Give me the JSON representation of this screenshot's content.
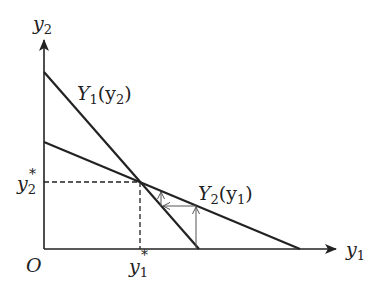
{
  "diagram": {
    "type": "reaction-function-diagram",
    "axes": {
      "x_label": "y",
      "x_label_sub": "1",
      "y_label": "y",
      "y_label_sub": "2",
      "origin_label": "O"
    },
    "curves": [
      {
        "name": "Y1(y2)",
        "label_main": "Y",
        "label_sub": "1",
        "label_arg": "(y",
        "label_arg_sub": "2",
        "label_close": ")"
      },
      {
        "name": "Y2(y1)",
        "label_main": "Y",
        "label_sub": "2",
        "label_arg": "(y",
        "label_arg_sub": "1",
        "label_close": ")"
      }
    ],
    "equilibrium": {
      "x_label": "y",
      "x_label_sub": "1",
      "x_label_sup": "*",
      "y_label": "y",
      "y_label_sub": "2",
      "y_label_sup": "*"
    },
    "colors": {
      "line": "#222222",
      "arrow": "#555555",
      "background": "#ffffff"
    }
  }
}
